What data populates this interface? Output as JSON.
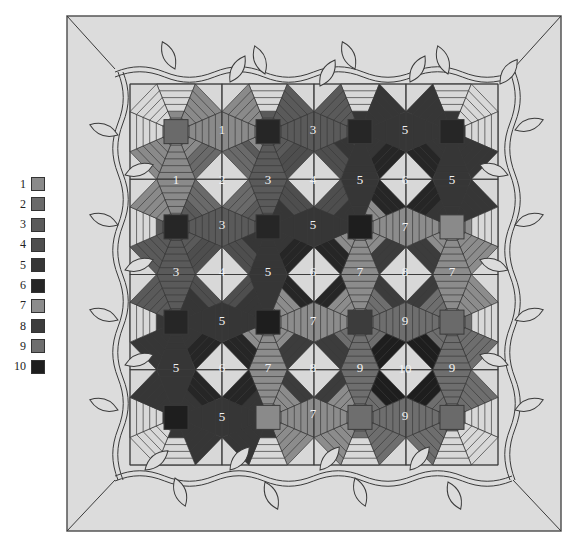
{
  "legend": {
    "items": [
      {
        "label": "1",
        "color": "#8a8a8a"
      },
      {
        "label": "2",
        "color": "#6a6a6a"
      },
      {
        "label": "3",
        "color": "#5a5a5a"
      },
      {
        "label": "4",
        "color": "#4e4e4e"
      },
      {
        "label": "5",
        "color": "#363636"
      },
      {
        "label": "6",
        "color": "#262626"
      },
      {
        "label": "7",
        "color": "#8c8c8c"
      },
      {
        "label": "8",
        "color": "#3c3c3c"
      },
      {
        "label": "9",
        "color": "#6e6e6e"
      },
      {
        "label": "10",
        "color": "#1e1e1e"
      }
    ]
  },
  "quilt": {
    "background": "#dcdcdc",
    "light_piece": "#d8d8d8",
    "line_color": "#3a3a3a",
    "block_centers": [
      {
        "x": 177,
        "y": 130,
        "value": "2"
      },
      {
        "x": 268,
        "y": 130,
        "value": "6"
      },
      {
        "x": 360,
        "y": 130,
        "value": "6"
      },
      {
        "x": 452,
        "y": 130,
        "value": "6"
      },
      {
        "x": 177,
        "y": 225,
        "value": "6"
      },
      {
        "x": 268,
        "y": 225,
        "value": "6"
      },
      {
        "x": 360,
        "y": 225,
        "value": "10"
      },
      {
        "x": 452,
        "y": 225,
        "value": "1"
      },
      {
        "x": 177,
        "y": 320,
        "value": "6"
      },
      {
        "x": 268,
        "y": 320,
        "value": "10"
      },
      {
        "x": 360,
        "y": 320,
        "value": "8"
      },
      {
        "x": 452,
        "y": 320,
        "value": "2"
      },
      {
        "x": 177,
        "y": 415,
        "value": "10"
      },
      {
        "x": 268,
        "y": 415,
        "value": "1"
      },
      {
        "x": 360,
        "y": 415,
        "value": "9"
      },
      {
        "x": 452,
        "y": 415,
        "value": "2"
      }
    ],
    "labels": [
      {
        "x": 222,
        "y": 130,
        "text": "1"
      },
      {
        "x": 313,
        "y": 130,
        "text": "3"
      },
      {
        "x": 405,
        "y": 130,
        "text": "5"
      },
      {
        "x": 176,
        "y": 180,
        "text": "1"
      },
      {
        "x": 222,
        "y": 180,
        "text": "2"
      },
      {
        "x": 268,
        "y": 180,
        "text": "3"
      },
      {
        "x": 313,
        "y": 180,
        "text": "4"
      },
      {
        "x": 360,
        "y": 180,
        "text": "5"
      },
      {
        "x": 405,
        "y": 180,
        "text": "6"
      },
      {
        "x": 452,
        "y": 180,
        "text": "5"
      },
      {
        "x": 222,
        "y": 225,
        "text": "3"
      },
      {
        "x": 313,
        "y": 225,
        "text": "5"
      },
      {
        "x": 405,
        "y": 227,
        "text": "7"
      },
      {
        "x": 176,
        "y": 272,
        "text": "3"
      },
      {
        "x": 222,
        "y": 272,
        "text": "4"
      },
      {
        "x": 268,
        "y": 272,
        "text": "5"
      },
      {
        "x": 313,
        "y": 272,
        "text": "6"
      },
      {
        "x": 360,
        "y": 272,
        "text": "7"
      },
      {
        "x": 405,
        "y": 272,
        "text": "8"
      },
      {
        "x": 452,
        "y": 272,
        "text": "7"
      },
      {
        "x": 222,
        "y": 321,
        "text": "5"
      },
      {
        "x": 313,
        "y": 321,
        "text": "7"
      },
      {
        "x": 405,
        "y": 321,
        "text": "9"
      },
      {
        "x": 176,
        "y": 368,
        "text": "5"
      },
      {
        "x": 222,
        "y": 368,
        "text": "6"
      },
      {
        "x": 268,
        "y": 368,
        "text": "7"
      },
      {
        "x": 313,
        "y": 368,
        "text": "8"
      },
      {
        "x": 360,
        "y": 368,
        "text": "9"
      },
      {
        "x": 405,
        "y": 369,
        "text": "10"
      },
      {
        "x": 452,
        "y": 368,
        "text": "9"
      },
      {
        "x": 222,
        "y": 417,
        "text": "5"
      },
      {
        "x": 313,
        "y": 414,
        "text": "7"
      },
      {
        "x": 405,
        "y": 416,
        "text": "9"
      }
    ]
  }
}
